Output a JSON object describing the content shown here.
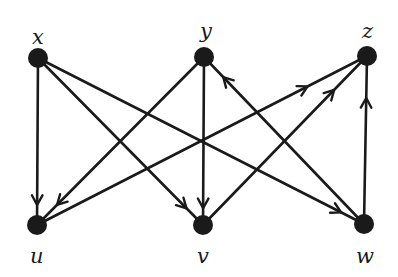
{
  "diagram": {
    "type": "directed-bipartite-graph",
    "colors": {
      "ink": "#1a1a1a",
      "background": "#ffffff"
    },
    "nodes": [
      {
        "id": "x",
        "label": "x",
        "cx": 38,
        "cy": 58,
        "lx": 32,
        "ly": 44,
        "r": 10
      },
      {
        "id": "y",
        "label": "y",
        "cx": 204,
        "cy": 57,
        "lx": 200,
        "ly": 38,
        "r": 10
      },
      {
        "id": "z",
        "label": "z",
        "cx": 367,
        "cy": 56,
        "lx": 362,
        "ly": 38,
        "r": 10
      },
      {
        "id": "u",
        "label": "u",
        "cx": 37,
        "cy": 225,
        "lx": 30,
        "ly": 263,
        "r": 10
      },
      {
        "id": "v",
        "label": "v",
        "cx": 203,
        "cy": 225,
        "lx": 197,
        "ly": 263,
        "r": 10
      },
      {
        "id": "w",
        "label": "w",
        "cx": 364,
        "cy": 224,
        "lx": 356,
        "ly": 263,
        "r": 10
      }
    ],
    "edges": [
      {
        "from": "x",
        "to": "u",
        "arrow_t": 0.88
      },
      {
        "from": "x",
        "to": "v",
        "arrow_t": 0.9
      },
      {
        "from": "x",
        "to": "w",
        "arrow_t": 0.93
      },
      {
        "from": "y",
        "to": "u",
        "arrow_t": 0.88
      },
      {
        "from": "y",
        "to": "v",
        "arrow_t": 0.9
      },
      {
        "from": "w",
        "to": "y",
        "arrow_t": 0.88
      },
      {
        "from": "u",
        "to": "z",
        "arrow_t": 0.82
      },
      {
        "from": "v",
        "to": "z",
        "arrow_t": 0.8
      },
      {
        "from": "w",
        "to": "z",
        "arrow_t": 0.75
      }
    ]
  }
}
